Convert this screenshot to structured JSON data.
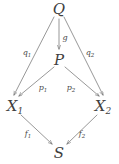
{
  "diagram": {
    "kind": "commutative-diagram",
    "stroke_color": "#6b6b6b",
    "label_color": "#3f3f3f",
    "background": "#ffffff",
    "nodes": [
      {
        "id": "Q",
        "base": "Q",
        "sub": "",
        "x": 59,
        "y": 9
      },
      {
        "id": "P",
        "base": "P",
        "sub": "",
        "x": 59,
        "y": 60
      },
      {
        "id": "X1",
        "base": "X",
        "sub": "1",
        "x": 15,
        "y": 106
      },
      {
        "id": "X2",
        "base": "X",
        "sub": "2",
        "x": 103,
        "y": 106
      },
      {
        "id": "S",
        "base": "S",
        "sub": "",
        "x": 59,
        "y": 153
      }
    ],
    "edges": [
      {
        "id": "q1",
        "base": "q",
        "sub": "1",
        "from": "Q",
        "to": "X1",
        "label_x": 27,
        "label_y": 53
      },
      {
        "id": "g",
        "base": "g",
        "sub": "",
        "from": "Q",
        "to": "P",
        "label_x": 65,
        "label_y": 38
      },
      {
        "id": "q2",
        "base": "q",
        "sub": "2",
        "from": "Q",
        "to": "X2",
        "label_x": 90,
        "label_y": 53
      },
      {
        "id": "p1",
        "base": "p",
        "sub": "1",
        "from": "P",
        "to": "X1",
        "label_x": 43,
        "label_y": 88
      },
      {
        "id": "p2",
        "base": "p",
        "sub": "2",
        "from": "P",
        "to": "X2",
        "label_x": 71,
        "label_y": 88
      },
      {
        "id": "f1",
        "base": "f",
        "sub": "1",
        "from": "X1",
        "to": "S",
        "label_x": 28,
        "label_y": 134
      },
      {
        "id": "f2",
        "base": "f",
        "sub": "2",
        "from": "X2",
        "to": "S",
        "label_x": 82,
        "label_y": 134
      }
    ],
    "arrow_paths": {
      "q1": "M 54 17 L 14 95",
      "g": "M 59 19 L 59 49",
      "q2": "M 64 17 L 103 95",
      "p1": "M 54 67 L 19 96",
      "p2": "M 65 67 L 99 96",
      "f1": "M 21 115 L 52 144",
      "f2": "M 97 115 L 67 144"
    }
  }
}
